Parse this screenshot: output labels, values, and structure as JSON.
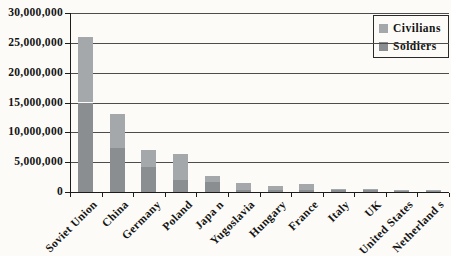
{
  "chart_data": {
    "type": "bar",
    "stacked": true,
    "title": "",
    "xlabel": "",
    "ylabel": "",
    "grid": true,
    "ylim": [
      0,
      30000000
    ],
    "ytick_interval": 5000000,
    "ytick_labels": [
      "0",
      "5,000,000",
      "10,000,000",
      "15,000,000",
      "20,000,000",
      "25,000,000",
      "30,000,000"
    ],
    "categories": [
      "Soviet Union",
      "China",
      "Germany",
      "Poland",
      "Japa n",
      "Yugoslavia",
      "Hungary",
      "France",
      "Italy",
      "UK",
      "United States",
      "Netherland s"
    ],
    "series": [
      {
        "name": "Soldiers",
        "position": "bottom",
        "color": "#8b8e91",
        "values": [
          15000000,
          7400000,
          4200000,
          2000000,
          1700000,
          400000,
          400000,
          400000,
          330000,
          330000,
          300000,
          200000
        ]
      },
      {
        "name": "Civilians",
        "position": "top",
        "color": "#a5a8ab",
        "values": [
          11000000,
          5600000,
          2800000,
          4300000,
          1000000,
          1050000,
          600000,
          1000000,
          170000,
          120000,
          120000,
          100000
        ]
      }
    ],
    "totals": [
      26000000,
      13000000,
      7000000,
      6300000,
      2700000,
      1450000,
      1000000,
      1400000,
      500000,
      450000,
      420000,
      300000
    ],
    "legend_position": "top-right"
  },
  "legend": {
    "civilians_label": "Civilians",
    "soldiers_label": "Soldiers"
  },
  "colors": {
    "background": "#fcfbf7",
    "gridline": "#4d4d4d",
    "axis": "#1c1c1c",
    "text": "#141414",
    "civilians": "#a5a8ab",
    "soldiers": "#8b8e91"
  }
}
